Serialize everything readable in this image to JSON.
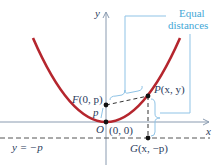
{
  "diagram": {
    "type": "parabola-focus-directrix",
    "axes": {
      "x_label": "x",
      "y_label": "y"
    },
    "points": {
      "focus": {
        "name": "F",
        "coords": "(0, p)"
      },
      "point": {
        "name": "P",
        "coords": "(x, y)"
      },
      "foot": {
        "name": "G",
        "coords": "(x, −p)"
      },
      "origin": {
        "name": "O",
        "coords": "(0, 0)"
      }
    },
    "segment_label": "p",
    "directrix_label": "y = −p",
    "annotation": {
      "line1": "Equal",
      "line2": "distances"
    },
    "colors": {
      "parabola": "#b5262e",
      "axes": "#8a9bb0",
      "annotation": "#3fa7d6",
      "text": "#2a3b5c",
      "dashed": "#333333"
    }
  }
}
